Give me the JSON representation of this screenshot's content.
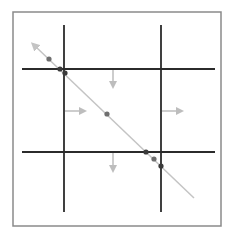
{
  "diagram": {
    "frame": {
      "x": 13,
      "y": 12,
      "w": 208,
      "h": 214,
      "color": "#8a8a8a"
    },
    "grid_color": "#2b2b2b",
    "vertical_lines": [
      {
        "x": 64,
        "y1": 25,
        "y2": 212
      },
      {
        "x": 161,
        "y1": 25,
        "y2": 212
      }
    ],
    "horizontal_lines": [
      {
        "y": 69,
        "x1": 22,
        "x2": 215
      },
      {
        "y": 152,
        "x1": 22,
        "x2": 215
      }
    ],
    "diagonal": {
      "x1": 36,
      "y1": 47,
      "x2": 194,
      "y2": 198,
      "color": "#c4c4c4",
      "arrow_start": true
    },
    "points": [
      {
        "x": 49,
        "y": 59,
        "color": "#6f6f6f"
      },
      {
        "x": 60,
        "y": 69,
        "color": "#3a3a3a"
      },
      {
        "x": 65,
        "y": 73,
        "color": "#3a3a3a"
      },
      {
        "x": 107,
        "y": 114,
        "color": "#6f6f6f"
      },
      {
        "x": 146,
        "y": 152,
        "color": "#3a3a3a"
      },
      {
        "x": 154,
        "y": 159,
        "color": "#6f6f6f"
      },
      {
        "x": 161,
        "y": 166,
        "color": "#3a3a3a"
      }
    ],
    "arrows": [
      {
        "name": "arrow-down-top",
        "x1": 113,
        "y1": 70,
        "x2": 113,
        "y2": 87
      },
      {
        "name": "arrow-right-left",
        "x1": 65,
        "y1": 111,
        "x2": 85,
        "y2": 111
      },
      {
        "name": "arrow-right-right",
        "x1": 162,
        "y1": 111,
        "x2": 182,
        "y2": 111
      },
      {
        "name": "arrow-down-bottom",
        "x1": 113,
        "y1": 153,
        "x2": 113,
        "y2": 171
      }
    ],
    "arrow_color": "#bdbdbd"
  }
}
